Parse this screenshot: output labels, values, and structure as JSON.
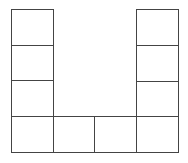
{
  "diagram": {
    "line_color": "#444444",
    "background": "#ffffff",
    "grid": {
      "columns": 4,
      "rows": 4,
      "cell_width": 41.5,
      "cell_height": 35.5,
      "origin_x": 11,
      "origin_y": 9
    },
    "cells": [
      {
        "id": "left-1",
        "col": 0,
        "row": 0
      },
      {
        "id": "left-2",
        "col": 0,
        "row": 1
      },
      {
        "id": "left-3",
        "col": 0,
        "row": 2
      },
      {
        "id": "bottom-1",
        "col": 0,
        "row": 3
      },
      {
        "id": "bottom-2",
        "col": 1,
        "row": 3
      },
      {
        "id": "bottom-3",
        "col": 2,
        "row": 3
      },
      {
        "id": "bottom-4",
        "col": 3,
        "row": 3
      },
      {
        "id": "right-3",
        "col": 3,
        "row": 2
      },
      {
        "id": "right-2",
        "col": 3,
        "row": 1
      },
      {
        "id": "right-1",
        "col": 3,
        "row": 0
      }
    ]
  }
}
